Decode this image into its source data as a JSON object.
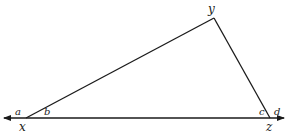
{
  "diagram": {
    "type": "triangle-with-extended-base",
    "stroke_color": "#1a1a1a",
    "background": "#ffffff",
    "vertices": {
      "x": {
        "label": "x"
      },
      "y": {
        "label": "y"
      },
      "z": {
        "label": "z"
      }
    },
    "angles": {
      "a": {
        "label": "a",
        "at_vertex": "x",
        "position": "exterior"
      },
      "b": {
        "label": "b",
        "at_vertex": "x",
        "position": "interior"
      },
      "c": {
        "label": "c",
        "at_vertex": "z",
        "position": "interior"
      },
      "d": {
        "label": "d",
        "at_vertex": "z",
        "position": "exterior"
      }
    },
    "base_line": {
      "extends_both_directions": true,
      "arrowheads": [
        "left",
        "right"
      ]
    }
  }
}
